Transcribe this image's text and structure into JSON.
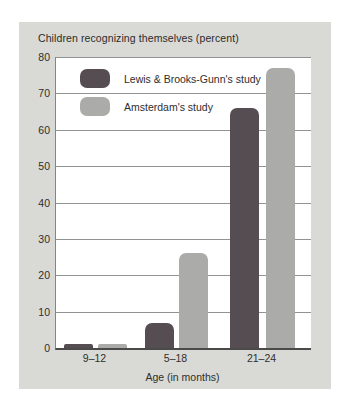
{
  "header": {
    "title": "Children recognizing themselves (percent)"
  },
  "axes": {
    "x_title": "Age (in months)"
  },
  "chart_data": {
    "type": "bar",
    "title": "Children recognizing themselves (percent)",
    "xlabel": "Age (in months)",
    "ylabel": "Children recognizing themselves (percent)",
    "categories": [
      "9–12",
      "5–18",
      "21–24"
    ],
    "series": [
      {
        "name": "Lewis & Brooks-Gunn's study",
        "color": "#564d52",
        "values": [
          1,
          7,
          66
        ]
      },
      {
        "name": "Amsterdam's study",
        "color": "#abaca9",
        "values": [
          1,
          26,
          77
        ]
      }
    ],
    "ylim": [
      0,
      80
    ],
    "yticks": [
      0,
      10,
      20,
      30,
      40,
      50,
      60,
      70,
      80
    ],
    "grid": true,
    "legend_position": "top-left"
  },
  "colors": {
    "panel_background": "#d9dad5",
    "plot_background": "#ffffff",
    "gridline": "#8f9392",
    "text": "#2e2e2e"
  }
}
